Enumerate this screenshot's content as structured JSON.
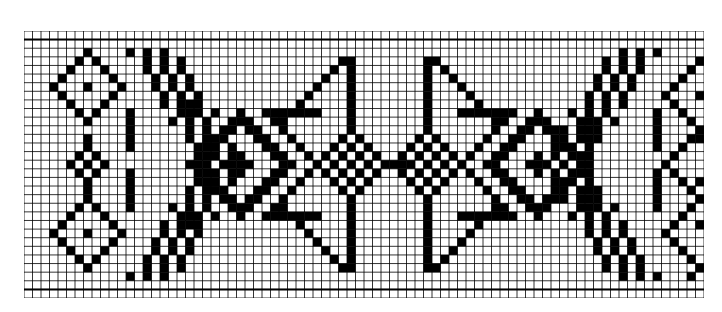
{
  "chart_data": {
    "type": "pattern-grid",
    "title": "",
    "grid": {
      "cols": 80,
      "rows": 31,
      "origin_px": [
        24,
        31
      ],
      "size_px": [
        680,
        267
      ],
      "thick_lines_after_rows": [
        0,
        29
      ],
      "line_color": "#000000",
      "fill_color": "#000000",
      "background": "#ffffff"
    },
    "motifs": [
      {
        "kind": "diamond_outline",
        "center": [
          6,
          7
        ],
        "radius": 4,
        "dot": true
      },
      {
        "kind": "diamond_outline",
        "center": [
          15,
          7
        ],
        "radius": 2,
        "dot": true,
        "stem": [
          [
            12,
            7
          ],
          [
            18,
            7
          ]
        ]
      },
      {
        "kind": "diamond_outline",
        "center": [
          23,
          7
        ],
        "radius": 4,
        "dot": true
      },
      {
        "kind": "chevron_band",
        "cols": [
          12,
          20
        ],
        "rows": [
          2,
          28
        ],
        "direction": "left"
      },
      {
        "kind": "diamond_outline",
        "center": [
          15,
          25
        ],
        "radius": 5,
        "cross": true
      },
      {
        "kind": "diamond_double",
        "center": [
          15,
          25
        ],
        "radius": 6
      },
      {
        "kind": "triangle_left",
        "apex": [
          15,
          30
        ],
        "bar_col": 38,
        "rows": [
          3,
          27
        ],
        "ledge_rows": [
          9,
          21
        ],
        "ledge_cols": [
          28,
          34
        ]
      },
      {
        "kind": "checker_diamond",
        "center": [
          15,
          38
        ],
        "radius": 4
      },
      {
        "kind": "checker_diamond",
        "center": [
          15,
          47
        ],
        "radius": 4
      },
      {
        "kind": "link",
        "row": 15,
        "cols": [
          41,
          44
        ]
      },
      {
        "kind": "triangle_right",
        "apex": [
          15,
          55
        ],
        "bar_col": 47,
        "rows": [
          3,
          27
        ],
        "ledge_rows": [
          9,
          21
        ],
        "ledge_cols": [
          51,
          57
        ]
      },
      {
        "kind": "diamond_outline",
        "center": [
          15,
          60
        ],
        "radius": 5,
        "cross": true
      },
      {
        "kind": "diamond_double",
        "center": [
          15,
          60
        ],
        "radius": 6
      },
      {
        "kind": "chevron_band",
        "cols": [
          65,
          74
        ],
        "rows": [
          2,
          28
        ],
        "direction": "right"
      },
      {
        "kind": "zigzag",
        "cols": [
          75,
          79
        ],
        "rows": [
          3,
          28
        ]
      }
    ]
  }
}
